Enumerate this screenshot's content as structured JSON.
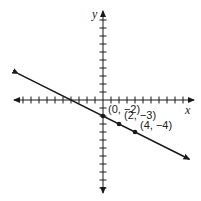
{
  "chart_data": {
    "type": "line",
    "title": "",
    "xlabel": "x",
    "ylabel": "y",
    "xlim": [
      -11,
      11
    ],
    "ylim": [
      -11,
      11
    ],
    "grid": false,
    "tick_interval": 1,
    "line": {
      "slope": -0.5,
      "intercept": -2,
      "equation": "y = -1/2 x - 2"
    },
    "points": [
      {
        "x": 0,
        "y": -2,
        "label": "(0, −2)"
      },
      {
        "x": 2,
        "y": -3,
        "label": "(2, −3)"
      },
      {
        "x": 4,
        "y": -4,
        "label": "(4, −4)"
      }
    ],
    "colors": {
      "line": "#1a1a1a",
      "axis": "#1a1a1a"
    }
  },
  "axes": {
    "x_label": "x",
    "y_label": "y"
  },
  "labels": [
    "(0, −2)",
    "(2, −3)",
    "(4, −4)"
  ]
}
